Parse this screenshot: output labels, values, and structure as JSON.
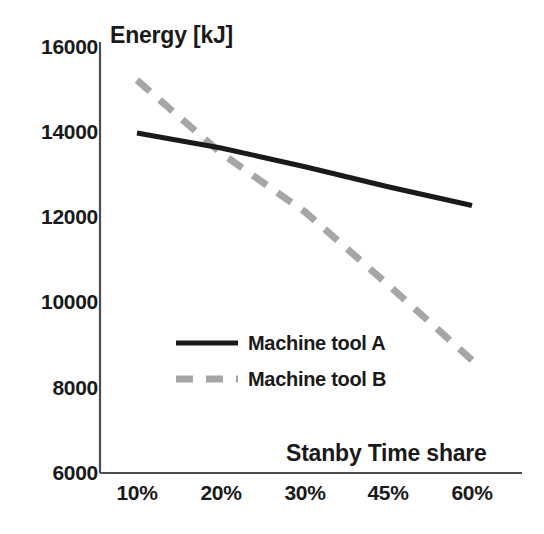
{
  "chart_data": {
    "type": "line",
    "title": "",
    "subtitle": "",
    "xlabel": "Stanby Time share",
    "ylabel": "Energy [kJ]",
    "categories": [
      "10%",
      "20%",
      "30%",
      "45%",
      "60%"
    ],
    "x_tick_labels": [
      "10%",
      "20%",
      "30%",
      "45%",
      "60%"
    ],
    "y_tick_labels": [
      "6000",
      "8000",
      "10000",
      "12000",
      "14000",
      "16000"
    ],
    "y_tick_values": [
      6000,
      8000,
      10000,
      12000,
      14000,
      16000
    ],
    "ylim": [
      6000,
      16000
    ],
    "grid": false,
    "legend_position": "inside-center-left",
    "series": [
      {
        "name": "Machine tool A",
        "style": "solid",
        "color": "#1a1a1a",
        "values": [
          13980,
          13630,
          13190,
          12720,
          12280
        ]
      },
      {
        "name": "Machine tool B",
        "style": "dashed",
        "color": "#a6a6a6",
        "values": [
          15220,
          13510,
          12130,
          10420,
          8650
        ]
      }
    ],
    "annotations": []
  },
  "legend": {
    "items": [
      {
        "label": "Machine tool A",
        "style": "solid",
        "color": "#1a1a1a"
      },
      {
        "label": "Machine tool B",
        "style": "dashed",
        "color": "#a6a6a6"
      }
    ]
  },
  "axes": {
    "line_color": "#4d4d4d",
    "text_color": "#1a1a1a"
  }
}
